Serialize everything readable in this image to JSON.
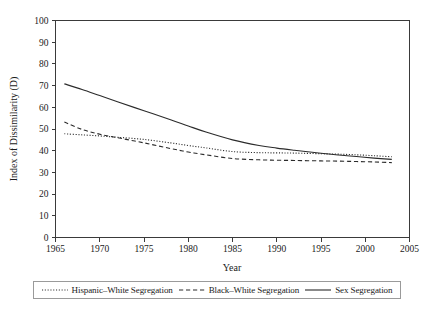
{
  "chart_data": {
    "type": "line",
    "title": "",
    "xlabel": "Year",
    "ylabel": "Index of Dissimilarity (D)",
    "xlim": [
      1965,
      2005
    ],
    "ylim": [
      0,
      100
    ],
    "grid": false,
    "legend_position": "bottom",
    "xticks": [
      1965,
      1970,
      1975,
      1980,
      1985,
      1990,
      1995,
      2000,
      2005
    ],
    "yticks": [
      0,
      10,
      20,
      30,
      40,
      50,
      60,
      70,
      80,
      90,
      100
    ],
    "x": [
      1966,
      1968,
      1970,
      1972,
      1975,
      1978,
      1980,
      1982,
      1985,
      1988,
      1990,
      1992,
      1995,
      1997,
      1999,
      2001,
      2003
    ],
    "series": [
      {
        "name": "Hispanic–White Segregation",
        "style": "dotted",
        "color": "#2b2b2b",
        "values": [
          47.8,
          47.3,
          46.8,
          46.2,
          45.2,
          43.6,
          42.4,
          41.3,
          39.6,
          39.1,
          39.0,
          38.9,
          38.6,
          38.4,
          38.1,
          37.7,
          37.2
        ]
      },
      {
        "name": "Black–White Segregation",
        "style": "dashed",
        "color": "#2b2b2b",
        "values": [
          53.2,
          49.8,
          47.6,
          46.0,
          43.6,
          41.0,
          39.4,
          38.1,
          36.4,
          35.8,
          35.6,
          35.5,
          35.3,
          35.2,
          35.0,
          34.8,
          34.5
        ]
      },
      {
        "name": "Sex Segregation",
        "style": "solid",
        "color": "#2b2b2b",
        "values": [
          70.8,
          68.2,
          65.4,
          62.6,
          58.4,
          54.3,
          51.4,
          48.6,
          45.0,
          42.4,
          41.2,
          40.2,
          38.8,
          38.0,
          37.3,
          36.6,
          36.0
        ]
      }
    ]
  },
  "axes": {
    "x_title": "Year",
    "y_title": "Index of Dissimilarity (D)"
  },
  "legend": {
    "entries": [
      {
        "label": "Hispanic–White Segregation",
        "style": "dotted"
      },
      {
        "label": "Black–White Segregation",
        "style": "dashed"
      },
      {
        "label": "Sex Segregation",
        "style": "solid"
      }
    ]
  }
}
